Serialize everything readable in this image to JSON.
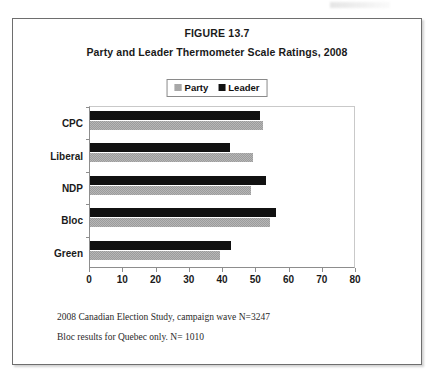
{
  "figure": {
    "number": "FIGURE 13.7",
    "title": "Party and Leader Thermometer Scale Ratings, 2008"
  },
  "footnotes": {
    "line1": "2008 Canadian Election Study, campaign wave   N=3247",
    "line2": "Bloc results for Quebec only.  N= 1010"
  },
  "colors": {
    "party": "#9c9c9c",
    "leader": "#111111",
    "frame": "#6e6e6e",
    "axis": "#8d8d8d"
  },
  "chart_data": {
    "type": "bar",
    "orientation": "horizontal",
    "title": "Party and Leader Thermometer Scale Ratings, 2008",
    "xlabel": "",
    "ylabel": "",
    "xlim": [
      0,
      80
    ],
    "xticks": [
      0,
      10,
      20,
      30,
      40,
      50,
      60,
      70,
      80
    ],
    "xtick_labels": [
      "0",
      "10",
      "20",
      "30",
      "40",
      "50",
      "60",
      "70",
      "80"
    ],
    "grid": false,
    "legend_position": "top-center",
    "categories": [
      "CPC",
      "Liberal",
      "NDP",
      "Bloc",
      "Green"
    ],
    "series": [
      {
        "name": "Party",
        "color": "#9c9c9c",
        "values": [
          52,
          49,
          48.5,
          54,
          39
        ]
      },
      {
        "name": "Leader",
        "color": "#111111",
        "values": [
          51,
          42,
          53,
          56,
          42.5
        ]
      }
    ]
  }
}
